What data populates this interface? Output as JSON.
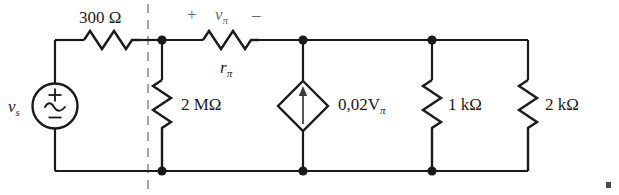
{
  "figure": {
    "kind": "electrical-circuit-schematic"
  },
  "labels": {
    "source_series_resistor": "300 Ω",
    "input_resistor": "2 MΩ",
    "pi_resistor_base": "r",
    "pi_resistor_sub": "π",
    "source_name_base": "v",
    "source_name_sub": "s",
    "polarity_plus": "+",
    "polarity_minus": "–",
    "vpi_base": "v",
    "vpi_sub": "π",
    "dependent_source_base": "0,02V",
    "dependent_source_sub": "π",
    "load_resistor_1": "1 kΩ",
    "load_resistor_2": "2 kΩ"
  },
  "components": {
    "independent_source": {
      "type": "ac-voltage-source",
      "symbol_plus": "+",
      "symbol_minus": "–",
      "waveform": "sine"
    },
    "dependent_source": {
      "type": "dependent-current-source",
      "shape": "diamond",
      "arrow_direction": "up"
    },
    "resistors": [
      {
        "name": "300-ohm-resistor",
        "orientation": "horizontal",
        "value": "300 Ω"
      },
      {
        "name": "r-pi-resistor",
        "orientation": "horizontal",
        "value": "rπ"
      },
      {
        "name": "2-megohm-resistor",
        "orientation": "vertical",
        "value": "2 MΩ"
      },
      {
        "name": "1-kilohm-resistor",
        "orientation": "vertical",
        "value": "1 kΩ"
      },
      {
        "name": "2-kilohm-resistor",
        "orientation": "vertical",
        "value": "2 kΩ"
      }
    ],
    "divider": {
      "name": "section-divider",
      "style": "dashed-vertical",
      "color": "#a8a8a8"
    }
  },
  "colors": {
    "wire": "#1a1a1a",
    "label": "#1a1a1a",
    "annotation": "#6b6b6b",
    "divider": "#a8a8a8",
    "background": "#ffffff"
  }
}
